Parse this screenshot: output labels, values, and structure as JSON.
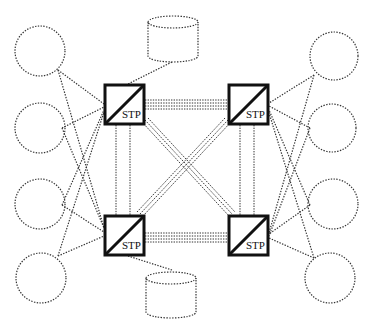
{
  "diagram": {
    "type": "network-topology",
    "stp_nodes": [
      {
        "id": "stp-top-left",
        "label": "STP",
        "x": 104,
        "y": 84
      },
      {
        "id": "stp-top-right",
        "label": "STP",
        "x": 228,
        "y": 84
      },
      {
        "id": "stp-bottom-left",
        "label": "STP",
        "x": 104,
        "y": 215
      },
      {
        "id": "stp-bottom-right",
        "label": "STP",
        "x": 228,
        "y": 215
      }
    ],
    "databases": [
      {
        "id": "db-top",
        "x": 147,
        "y": 14
      },
      {
        "id": "db-bottom",
        "x": 145,
        "y": 272
      }
    ],
    "left_endpoints": 4,
    "right_endpoints": 4,
    "colors": {
      "stroke": "#111111",
      "background": "#ffffff"
    }
  }
}
